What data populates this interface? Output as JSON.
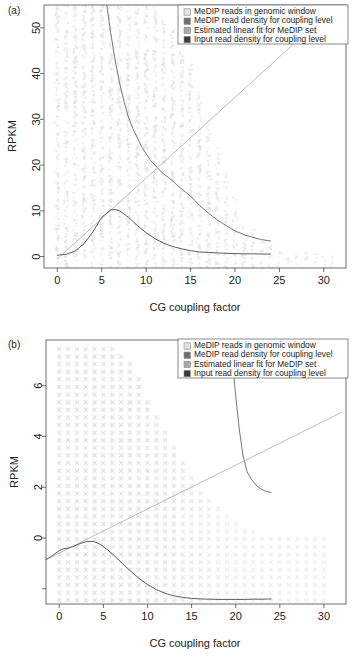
{
  "figure": {
    "panels": [
      {
        "id": "a",
        "label": "(a)",
        "xlabel": "CG coupling factor",
        "ylabel": "RPKM",
        "xticks": [
          0,
          5,
          10,
          15,
          20,
          25,
          30
        ],
        "yticks": [
          0,
          10,
          20,
          30,
          40,
          50
        ],
        "xlim": [
          -1.5,
          32.5
        ],
        "ylim": [
          -2.5,
          55
        ],
        "marker": "vertical-stripe",
        "legend": {
          "position": "top-right",
          "items": [
            {
              "label": "MeDIP reads in genomic window",
              "swatch": "#e2e2e2",
              "key": "medip-reads"
            },
            {
              "label": "MeDIP read density for coupling level",
              "swatch": "#707070",
              "key": "medip-density"
            },
            {
              "label": "Estimated linear fit for MeDIP set",
              "swatch": "#a8a8a8",
              "key": "linear-fit"
            },
            {
              "label": "Input read density for coupling level",
              "swatch": "#3a3a3a",
              "key": "input-density"
            }
          ]
        }
      },
      {
        "id": "b",
        "label": "(b)",
        "xlabel": "CG coupling factor",
        "ylabel": "RPKM",
        "xticks": [
          0,
          5,
          10,
          15,
          20,
          25,
          30
        ],
        "yticks": [
          0,
          2,
          4,
          6
        ],
        "xlim": [
          -1.5,
          32.5
        ],
        "ylim": [
          -2.6,
          7.8
        ],
        "marker": "cross",
        "legend": {
          "position": "top-right",
          "items": [
            {
              "label": "MeDIP reads in genomic window",
              "swatch": "#e2e2e2",
              "key": "medip-reads"
            },
            {
              "label": "MeDIP read density for coupling level",
              "swatch": "#707070",
              "key": "medip-density"
            },
            {
              "label": "Estimated linear fit for MeDIP set",
              "swatch": "#a8a8a8",
              "key": "linear-fit"
            },
            {
              "label": "Input read density for coupling level",
              "swatch": "#3a3a3a",
              "key": "input-density"
            }
          ]
        }
      }
    ]
  },
  "chart_data": [
    {
      "type": "scatter",
      "panel": "a",
      "title": "",
      "xlabel": "CG coupling factor",
      "ylabel": "RPKM",
      "xlim": [
        -1.5,
        32.5
      ],
      "ylim": [
        -2.5,
        55
      ],
      "grid": false,
      "legend_position": "top-right",
      "series": [
        {
          "name": "MeDIP reads in genomic window",
          "type": "scatter",
          "color": "#e2e2e2",
          "marker": "point-column",
          "note": "Dense vertical columns of points at each integer CG coupling factor, spanning the full RPKM range; density greatest for CG 1-14 and thinning beyond CG 20.",
          "column_x": [
            0,
            1,
            2,
            3,
            4,
            5,
            6,
            7,
            8,
            9,
            10,
            11,
            12,
            13,
            14,
            15,
            16,
            17,
            18,
            19,
            20,
            21,
            22,
            23,
            24,
            25,
            26,
            27,
            28,
            29,
            30,
            31
          ],
          "column_max_rpkm": [
            55,
            55,
            55,
            55,
            55,
            55,
            55,
            55,
            55,
            55,
            55,
            55,
            52,
            50,
            46,
            42,
            36,
            30,
            24,
            18,
            13,
            9,
            6,
            4,
            3,
            2,
            1.5,
            1,
            1,
            0.8,
            0.6,
            0.5
          ]
        },
        {
          "name": "MeDIP read density for coupling level",
          "type": "line",
          "color": "#6f6f6f",
          "x": [
            5.0,
            5.5,
            6,
            6.5,
            7,
            7.5,
            8,
            8.5,
            9,
            9.5,
            10,
            10.5,
            11,
            11.5,
            12,
            12.5,
            13,
            13.5,
            14,
            14.5,
            15,
            15.5,
            16,
            17,
            18,
            19,
            20,
            21,
            22,
            23,
            24
          ],
          "y": [
            63,
            56,
            49,
            43,
            38,
            34,
            30.5,
            28,
            26,
            24,
            22.5,
            21,
            20,
            18.9,
            18,
            17.3,
            16.5,
            15.6,
            14.8,
            14,
            13.2,
            12.2,
            11.2,
            9.5,
            8.0,
            6.8,
            5.6,
            4.8,
            4.2,
            3.7,
            3.4
          ]
        },
        {
          "name": "Estimated linear fit for MeDIP set",
          "type": "line",
          "color": "#b4b4b4",
          "x": [
            0,
            32
          ],
          "y": [
            -0.5,
            56
          ],
          "slope": 1.77,
          "intercept": -0.5
        },
        {
          "name": "Input read density for coupling level",
          "type": "line",
          "color": "#555555",
          "x": [
            0,
            1,
            2,
            3,
            4,
            5,
            6,
            6.5,
            7,
            8,
            9,
            10,
            11,
            12,
            13,
            14,
            15,
            16,
            17,
            18,
            19,
            20,
            21,
            22,
            23,
            24
          ],
          "y": [
            0.3,
            0.5,
            1.2,
            2.8,
            5.4,
            8.6,
            10.2,
            10.3,
            10.0,
            8.6,
            6.8,
            5.2,
            3.9,
            2.9,
            2.2,
            1.7,
            1.3,
            1.0,
            0.9,
            0.8,
            0.7,
            0.65,
            0.6,
            0.6,
            0.55,
            0.55
          ]
        }
      ]
    },
    {
      "type": "scatter",
      "panel": "b",
      "title": "",
      "xlabel": "CG coupling factor",
      "ylabel": "RPKM",
      "xlim": [
        -1.5,
        32.5
      ],
      "ylim": [
        -2.6,
        7.8
      ],
      "grid": false,
      "legend_position": "top-right",
      "series": [
        {
          "name": "MeDIP reads in genomic window",
          "type": "scatter",
          "color": "#e2e2e2",
          "marker": "cross",
          "note": "Regular lattice of x-shaped markers at integer CG coupling factors and quantised RPKM levels; dense block for CG 0-9 over the full y-range, thinning progressively to CG 30.",
          "column_x": [
            0,
            1,
            2,
            3,
            4,
            5,
            6,
            7,
            8,
            9,
            10,
            11,
            12,
            13,
            14,
            15,
            16,
            17,
            18,
            19,
            20,
            21,
            22,
            23,
            24,
            25,
            26,
            27,
            28,
            29,
            30
          ],
          "column_max_rpkm": [
            7.6,
            7.6,
            7.6,
            7.6,
            7.6,
            7.6,
            7.6,
            7.4,
            7.0,
            6.4,
            5.6,
            4.9,
            4.2,
            3.6,
            3.0,
            2.5,
            2.0,
            1.6,
            1.2,
            0.9,
            0.6,
            0.4,
            0.3,
            0.2,
            0.1,
            0.05,
            0.0,
            0.0,
            0.0,
            0.0,
            0.0
          ]
        },
        {
          "name": "MeDIP read density for coupling level",
          "type": "line",
          "color": "#6f6f6f",
          "x": [
            19.6,
            20.0,
            20.4,
            20.8,
            21.0,
            21.3,
            21.8,
            22.4,
            23.0,
            23.6,
            24.0
          ],
          "y": [
            7.1,
            5.6,
            4.3,
            3.3,
            3.0,
            2.6,
            2.3,
            2.05,
            1.9,
            1.82,
            1.8
          ]
        },
        {
          "name": "Estimated linear fit for MeDIP set",
          "type": "line",
          "color": "#b4b4b4",
          "x": [
            -1.5,
            32
          ],
          "y": [
            -0.85,
            4.95
          ],
          "slope": 0.173,
          "intercept": -0.6
        },
        {
          "name": "Input read density for coupling level",
          "type": "line",
          "color": "#555555",
          "x": [
            -1.5,
            -1,
            0,
            0.5,
            1,
            1.5,
            2,
            2.5,
            3,
            3.5,
            4,
            4.5,
            5,
            6,
            7,
            8,
            9,
            10,
            11,
            12,
            13,
            14,
            15,
            16,
            17,
            18,
            19,
            20,
            21,
            22,
            23,
            24
          ],
          "y": [
            -0.85,
            -0.75,
            -0.5,
            -0.42,
            -0.4,
            -0.35,
            -0.27,
            -0.2,
            -0.15,
            -0.13,
            -0.15,
            -0.22,
            -0.33,
            -0.62,
            -0.95,
            -1.28,
            -1.58,
            -1.83,
            -2.03,
            -2.18,
            -2.28,
            -2.34,
            -2.38,
            -2.4,
            -2.41,
            -2.42,
            -2.42,
            -2.42,
            -2.42,
            -2.41,
            -2.41,
            -2.4
          ]
        }
      ]
    }
  ]
}
